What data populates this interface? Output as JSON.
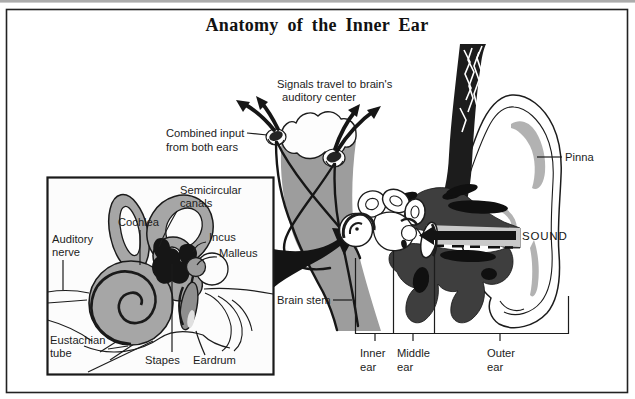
{
  "title": "Anatomy of the Inner Ear",
  "colors": {
    "ink": "#1c1c1c",
    "structure_gray": "#a6a6a6",
    "brainstem_gray": "#9d9d9d",
    "bone_dark": "#3e3e3e",
    "shade_gray": "#b2b2b2",
    "canal_gray": "#c9c9c9",
    "eardrum_gray": "#8e8e8e",
    "arrow_black": "#141414"
  },
  "inset": {
    "semicircular_line1": "Semicircular",
    "semicircular_line2": "canals",
    "cochlea": "Cochlea",
    "auditory_line1": "Auditory",
    "auditory_line2": "nerve",
    "incus": "Incus",
    "malleus": "Malleus",
    "eustachian_line1": "Eustachian",
    "eustachian_line2": "tube",
    "stapes": "Stapes",
    "eardrum": "Eardrum"
  },
  "brainstem": {
    "signals_line1": "Signals travel to brain's",
    "signals_line2": "auditory center",
    "combined_line1": "Combined input",
    "combined_line2": "from both ears",
    "label": "Brain stem"
  },
  "ear": {
    "pinna": "Pinna",
    "sound": "SOUND"
  },
  "regions": {
    "inner_line1": "Inner",
    "inner_line2": "ear",
    "middle_line1": "Middle",
    "middle_line2": "ear",
    "outer_line1": "Outer",
    "outer_line2": "ear"
  }
}
